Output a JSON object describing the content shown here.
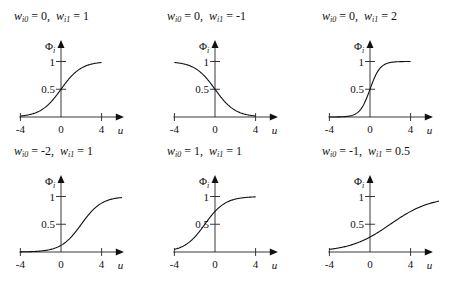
{
  "figure": {
    "y_axis_label": "Φ",
    "y_axis_subscript": "i",
    "x_axis_label": "u",
    "x_ticks": [
      "-4",
      "0",
      "4"
    ],
    "y_ticks": [
      "0.5",
      "1"
    ]
  },
  "panels": [
    {
      "title_w0": "0",
      "title_w1": "1"
    },
    {
      "title_w0": "0",
      "title_w1": "-1"
    },
    {
      "title_w0": "0",
      "title_w1": "2"
    },
    {
      "title_w0": "-2",
      "title_w1": "1"
    },
    {
      "title_w0": "1",
      "title_w1": "1"
    },
    {
      "title_w0": "-1",
      "title_w1": "0.5"
    }
  ],
  "chart_data": [
    {
      "type": "line",
      "title": "w_i0 = 0, w_i1 = 1",
      "xlabel": "u",
      "ylabel": "Φ_i",
      "function": "1/(1+exp(-(w0 + w1*u)))",
      "w0": 0,
      "w1": 1,
      "x_range": [
        -4,
        4
      ],
      "xticks": [
        -4,
        0,
        4
      ],
      "yticks": [
        0.5,
        1
      ],
      "ylim": [
        0,
        1.2
      ],
      "x": [
        -4,
        -2,
        0,
        2,
        4
      ],
      "values": [
        0.018,
        0.119,
        0.5,
        0.881,
        0.982
      ],
      "grid": false
    },
    {
      "type": "line",
      "title": "w_i0 = 0, w_i1 = -1",
      "xlabel": "u",
      "ylabel": "Φ_i",
      "function": "1/(1+exp(-(w0 + w1*u)))",
      "w0": 0,
      "w1": -1,
      "x_range": [
        -4,
        4
      ],
      "xticks": [
        -4,
        0,
        4
      ],
      "yticks": [
        0.5,
        1
      ],
      "ylim": [
        0,
        1.2
      ],
      "x": [
        -4,
        -2,
        0,
        2,
        4
      ],
      "values": [
        0.982,
        0.881,
        0.5,
        0.119,
        0.018
      ],
      "grid": false
    },
    {
      "type": "line",
      "title": "w_i0 = 0, w_i1 = 2",
      "xlabel": "u",
      "ylabel": "Φ_i",
      "function": "1/(1+exp(-(w0 + w1*u)))",
      "w0": 0,
      "w1": 2,
      "x_range": [
        -4,
        4
      ],
      "xticks": [
        -4,
        0,
        4
      ],
      "yticks": [
        0.5,
        1
      ],
      "ylim": [
        0,
        1.2
      ],
      "x": [
        -4,
        -2,
        0,
        2,
        4
      ],
      "values": [
        0.0003,
        0.018,
        0.5,
        0.982,
        0.9997
      ],
      "grid": false
    },
    {
      "type": "line",
      "title": "w_i0 = -2, w_i1 = 1",
      "xlabel": "u",
      "ylabel": "Φ_i",
      "function": "1/(1+exp(-(w0 + w1*u)))",
      "w0": -2,
      "w1": 1,
      "x_range": [
        -4,
        6
      ],
      "xticks": [
        -4,
        0,
        4
      ],
      "yticks": [
        0.5,
        1
      ],
      "ylim": [
        0,
        1.2
      ],
      "x": [
        -4,
        -2,
        0,
        2,
        4,
        6
      ],
      "values": [
        0.002,
        0.018,
        0.119,
        0.5,
        0.881,
        0.982
      ],
      "grid": false
    },
    {
      "type": "line",
      "title": "w_i0 = 1, w_i1 = 1",
      "xlabel": "u",
      "ylabel": "Φ_i",
      "function": "1/(1+exp(-(w0 + w1*u)))",
      "w0": 1,
      "w1": 1,
      "x_range": [
        -4,
        4
      ],
      "xticks": [
        -4,
        0,
        4
      ],
      "yticks": [
        0.5,
        1
      ],
      "ylim": [
        0,
        1.2
      ],
      "x": [
        -4,
        -2,
        0,
        2,
        4
      ],
      "values": [
        0.047,
        0.269,
        0.731,
        0.953,
        0.993
      ],
      "grid": false
    },
    {
      "type": "line",
      "title": "w_i0 = -1, w_i1 = 0.5",
      "xlabel": "u",
      "ylabel": "Φ_i",
      "function": "1/(1+exp(-(w0 + w1*u)))",
      "w0": -1,
      "w1": 0.5,
      "x_range": [
        -4,
        6.8
      ],
      "xticks": [
        -4,
        0,
        4
      ],
      "yticks": [
        0.5,
        1
      ],
      "ylim": [
        0,
        1.2
      ],
      "x": [
        -4,
        -2,
        0,
        2,
        4,
        6.8
      ],
      "values": [
        0.047,
        0.119,
        0.269,
        0.5,
        0.731,
        0.917
      ],
      "grid": false
    }
  ]
}
